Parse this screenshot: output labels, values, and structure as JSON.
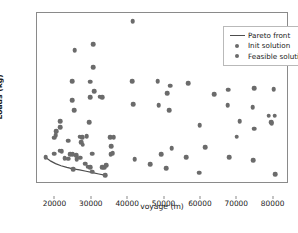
{
  "chart_data": {
    "type": "scatter",
    "title": "",
    "xlabel": "voyage (m)",
    "ylabel": "Loads (kg)",
    "xlim": [
      15200,
      84500
    ],
    "ylim": [
      -0.38,
      7.85
    ],
    "xticks": [
      20000,
      30000,
      40000,
      50000,
      60000,
      70000,
      80000
    ],
    "xtick_labels": [
      "20000",
      "30000",
      "40000",
      "50000",
      "60000",
      "70000",
      "80000"
    ],
    "yticks": [
      0,
      1,
      2,
      3,
      4,
      5,
      6,
      7
    ],
    "ytick_labels": [
      "0",
      "1",
      "2",
      "3",
      "4",
      "5",
      "6",
      "7"
    ],
    "grid": false,
    "legend_position": "upper right",
    "marker_color": "#6b6b6b",
    "line_color": "#4d4d4d",
    "frame_color": "#8a8a8a",
    "legend": [
      {
        "label": "Pareto front",
        "key": "line"
      },
      {
        "label": "Init solution",
        "key": "marker"
      },
      {
        "label": "Feasible solutions",
        "key": "marker"
      }
    ],
    "series": [
      {
        "name": "Pareto front",
        "type": "line",
        "points": [
          [
            17600,
            0.9
          ],
          [
            19000,
            0.72
          ],
          [
            20300,
            0.6
          ],
          [
            21800,
            0.5
          ],
          [
            23400,
            0.42
          ],
          [
            25100,
            0.345
          ],
          [
            26900,
            0.3
          ],
          [
            28700,
            0.235
          ],
          [
            30500,
            0.165
          ],
          [
            32200,
            0.1
          ],
          [
            33800,
            0.045
          ]
        ]
      },
      {
        "name": "Feasible solutions",
        "type": "scatter",
        "points": [
          [
            41500,
            7.45
          ],
          [
            25600,
            6.06
          ],
          [
            30600,
            6.36
          ],
          [
            30700,
            5.24
          ],
          [
            24800,
            4.58
          ],
          [
            29800,
            4.55
          ],
          [
            41300,
            4.56
          ],
          [
            48400,
            4.57
          ],
          [
            51800,
            4.36
          ],
          [
            56700,
            4.47
          ],
          [
            30900,
            4.09
          ],
          [
            29900,
            3.79
          ],
          [
            32400,
            3.82
          ],
          [
            33100,
            3.79
          ],
          [
            51000,
            3.98
          ],
          [
            63900,
            3.93
          ],
          [
            67700,
            4.16
          ],
          [
            75000,
            4.22
          ],
          [
            80300,
            4.18
          ],
          [
            24900,
            3.64
          ],
          [
            41600,
            3.46
          ],
          [
            48700,
            3.41
          ],
          [
            67600,
            3.4
          ],
          [
            74500,
            3.31
          ],
          [
            25400,
            3.18
          ],
          [
            51600,
            3.18
          ],
          [
            70900,
            2.63
          ],
          [
            78900,
            2.9
          ],
          [
            80600,
            2.9
          ],
          [
            79600,
            2.6
          ],
          [
            79700,
            2.55
          ],
          [
            29500,
            2.6
          ],
          [
            21500,
            2.65
          ],
          [
            75000,
            2.29
          ],
          [
            59900,
            2.46
          ],
          [
            20400,
            2.15
          ],
          [
            21500,
            2.34
          ],
          [
            20300,
            1.96
          ],
          [
            19900,
            1.85
          ],
          [
            26900,
            1.9
          ],
          [
            27600,
            1.88
          ],
          [
            28900,
            1.92
          ],
          [
            35300,
            1.88
          ],
          [
            36300,
            1.87
          ],
          [
            70100,
            1.9
          ],
          [
            23700,
            1.7
          ],
          [
            27400,
            1.62
          ],
          [
            27800,
            1.52
          ],
          [
            35600,
            1.45
          ],
          [
            52200,
            1.33
          ],
          [
            61500,
            1.4
          ],
          [
            21400,
            1.22
          ],
          [
            22000,
            1.2
          ],
          [
            24300,
            1.04
          ],
          [
            25000,
            1.06
          ],
          [
            20000,
            1.08
          ],
          [
            25900,
            1.02
          ],
          [
            30400,
            1.08
          ],
          [
            35500,
            1.05
          ],
          [
            36000,
            1.1
          ],
          [
            49300,
            1.05
          ],
          [
            56300,
            0.9
          ],
          [
            68000,
            0.92
          ],
          [
            22800,
            0.86
          ],
          [
            23700,
            0.84
          ],
          [
            26100,
            0.8
          ],
          [
            27000,
            0.88
          ],
          [
            42100,
            0.8
          ],
          [
            74700,
            0.76
          ],
          [
            28400,
            0.6
          ],
          [
            29100,
            0.46
          ],
          [
            29800,
            0.44
          ],
          [
            33200,
            0.44
          ],
          [
            33600,
            0.4
          ],
          [
            34300,
            0.52
          ],
          [
            46300,
            0.56
          ],
          [
            50800,
            0.37
          ],
          [
            59800,
            0.16
          ],
          [
            80700,
            0.1
          ],
          [
            17600,
            0.9
          ],
          [
            25200,
            0.345
          ],
          [
            30300,
            0.22
          ],
          [
            33900,
            0.04
          ]
        ]
      }
    ]
  }
}
